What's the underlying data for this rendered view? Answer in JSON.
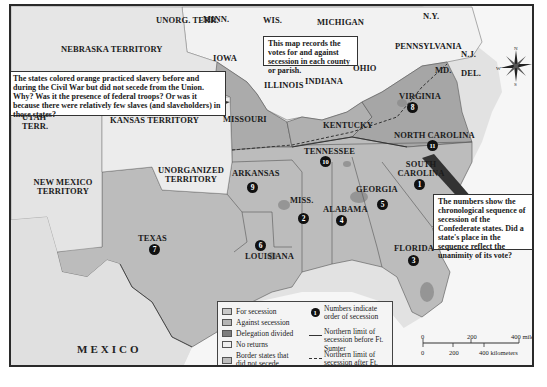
{
  "map": {
    "title": "Secession votes by county or parish",
    "regions": {
      "unorg_terr_north": "UNORG. TERR.",
      "minn": "MINN.",
      "wis": "WIS.",
      "michigan": "MICHIGAN",
      "ny": "N.Y.",
      "nebraska": "NEBRASKA TERRITORY",
      "iowa": "IOWA",
      "illinois": "ILLINOIS",
      "indiana": "INDIANA",
      "ohio": "OHIO",
      "pennsylvania": "PENNSYLVANIA",
      "nj": "N.J.",
      "md": "MD.",
      "del": "DEL.",
      "utah": "UTAH TERR.",
      "kansas": "KANSAS TERRITORY",
      "missouri": "MISSOURI",
      "virginia": "VIRGINIA",
      "kentucky": "KENTUCKY",
      "north_carolina": "NORTH CAROLINA",
      "tennessee": "TENNESSEE",
      "new_mexico": "NEW MEXICO TERRITORY",
      "unorganized": "UNORGANIZED TERRITORY",
      "arkansas": "ARKANSAS",
      "south_carolina": "SOUTH CAROLINA",
      "georgia": "GEORGIA",
      "miss": "MISS.",
      "alabama": "ALABAMA",
      "texas": "TEXAS",
      "louisiana": "LOUISIANA",
      "florida": "FLORIDA",
      "mexico": "MEXICO"
    },
    "secession_order": {
      "south_carolina": "1",
      "mississippi": "2",
      "florida": "3",
      "alabama": "4",
      "georgia": "5",
      "louisiana": "6",
      "texas": "7",
      "virginia": "8",
      "arkansas": "9",
      "tennessee": "10",
      "north_carolina": "11"
    },
    "callouts": {
      "border_states": "The states colored orange practiced slavery before and during the Civil War but did not secede from the Union. Why? Was it the presence of federal troops? Or was it because there were relatively few slaves (and slaveholders) in those states?",
      "votes": "This map records the votes for and against secession in each county or parish.",
      "numbers": "The numbers show the chronological sequence of secession of the Confederate states. Did a state's place in the sequence reflect the unanimity of its vote?"
    },
    "compass": {
      "n": "N",
      "s": "S",
      "e": "E",
      "w": "W"
    },
    "legend": {
      "items": [
        {
          "label": "For secession",
          "color": "#c8c8c8"
        },
        {
          "label": "Against secession",
          "color": "#b4b4b4"
        },
        {
          "label": "Delegation divided",
          "color": "#7d7d7d"
        },
        {
          "label": "No returns",
          "color": "#efefef"
        },
        {
          "label": "Border states that did not secede",
          "color": "#bdbdbd"
        }
      ],
      "symbols": [
        {
          "symbol": "1",
          "label": "Numbers indicate order of secession"
        },
        {
          "label": "Northern limit of secession before Ft. Sumter"
        },
        {
          "label": "Northern limit of secession after Ft. Sumter"
        }
      ]
    },
    "scale": {
      "miles": [
        "0",
        "200",
        "400 miles"
      ],
      "km": [
        "0",
        "200",
        "400 kilometers"
      ]
    },
    "colors": {
      "secession": "#b9b9b9",
      "border_states": "#a9a9a9",
      "union": "#f1f1f1",
      "terrain": "#e3e3e3",
      "water": "#f7f7f7",
      "divided": "#8a8a8a"
    }
  }
}
